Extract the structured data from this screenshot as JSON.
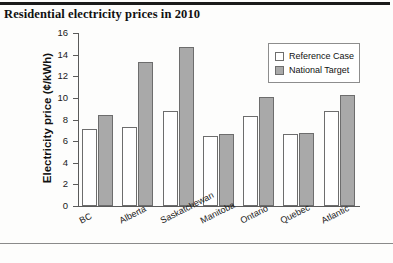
{
  "figure": {
    "title": "Residential electricity prices in 2010"
  },
  "chart_data": {
    "type": "bar",
    "title": "Residential electricity prices in 2010",
    "xlabel": "",
    "ylabel": "Electricity price (¢/kWh)",
    "ylim": [
      0,
      16
    ],
    "yticks": [
      0,
      2,
      4,
      6,
      8,
      10,
      12,
      14,
      16
    ],
    "ytick_labels": [
      "0",
      "2",
      "4",
      "6",
      "8",
      "10",
      "12",
      "14",
      "16"
    ],
    "grid": false,
    "legend_position": "top-right",
    "categories": [
      "BC",
      "Alberta",
      "Saskatchewan",
      "Manitoba",
      "Ontario",
      "Quebec",
      "Atlantic"
    ],
    "series": [
      {
        "name": "Reference Case",
        "color": "#ffffff",
        "values": [
          7.1,
          7.3,
          8.8,
          6.5,
          8.3,
          6.65,
          8.8
        ]
      },
      {
        "name": "National Target",
        "color": "#a9a9a9",
        "values": [
          8.4,
          13.3,
          14.75,
          6.65,
          10.1,
          6.75,
          10.25
        ]
      }
    ]
  }
}
